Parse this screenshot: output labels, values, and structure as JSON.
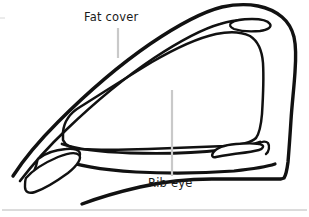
{
  "figure": {
    "type": "line-drawing",
    "background_color": "#ffffff",
    "ink_color": "#111111",
    "leader_line_color": "#c9c9c9",
    "rule_color": "#b8b8b8",
    "width": 309,
    "height": 217
  },
  "labels": {
    "fat_cover": "Fat cover",
    "rib_eye": "Rib eye"
  },
  "annotations": {
    "leader_fat_cover": {
      "x": 118,
      "y_start": 28,
      "y_end": 58
    },
    "leader_rib_eye": {
      "x": 172,
      "y_start": 90,
      "y_end": 176
    }
  },
  "separator": {
    "y": 210,
    "x_start": 2,
    "x_end": 307
  }
}
